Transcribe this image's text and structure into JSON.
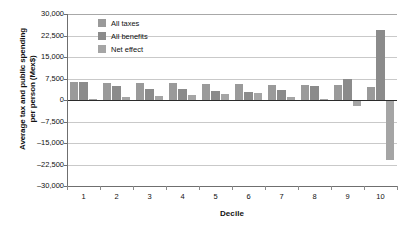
{
  "chart_data": {
    "type": "bar",
    "title": "",
    "xlabel": "Decile",
    "ylabel": "Average tax and public spending per person (Mex$)",
    "ylabel_line1": "Average tax and public spending",
    "ylabel_line2": "per person (Mex$)",
    "categories": [
      "1",
      "2",
      "3",
      "4",
      "5",
      "6",
      "7",
      "8",
      "9",
      "10"
    ],
    "series": [
      {
        "name": "All taxes",
        "color": "#9a9a9a",
        "values": [
          6400,
          5800,
          5800,
          5800,
          5500,
          5700,
          5400,
          5100,
          5100,
          4700
        ]
      },
      {
        "name": "All benefits",
        "color": "#8b8b8b",
        "values": [
          6300,
          4800,
          4000,
          3800,
          3200,
          2700,
          3500,
          5000,
          7300,
          24500
        ]
      },
      {
        "name": "Net effect",
        "color": "#a5a5a5",
        "values": [
          200,
          900,
          1500,
          1800,
          2200,
          2500,
          1200,
          200,
          -2000,
          -21000
        ]
      }
    ],
    "ylim": [
      -30000,
      30000
    ],
    "yticks": [
      "30,000",
      "22,500",
      "15,000",
      "7,500",
      "0",
      "-7,500",
      "-15,000",
      "-22,500",
      "-30,000"
    ],
    "ytick_values": [
      30000,
      22500,
      15000,
      7500,
      0,
      -7500,
      -15000,
      -22500,
      -30000
    ],
    "grid": true,
    "legend_position": "top-left"
  }
}
